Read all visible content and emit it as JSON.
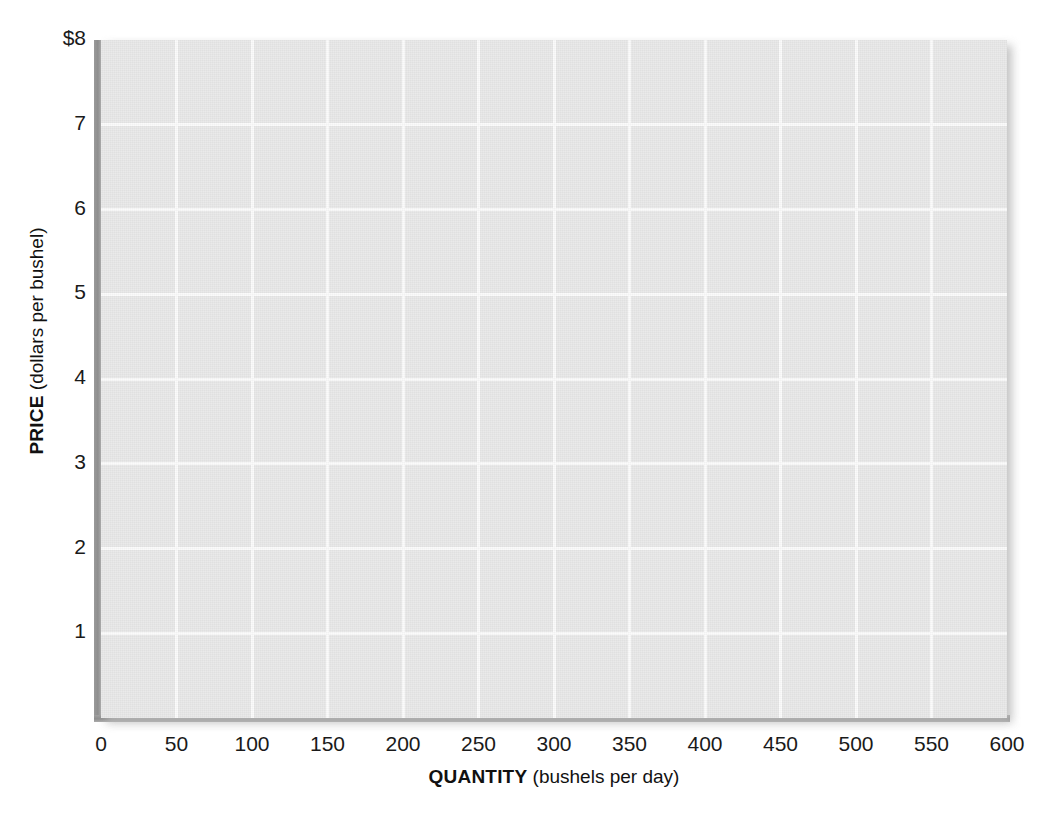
{
  "chart_data": {
    "type": "line",
    "title": "",
    "subtitle": "",
    "xlabel_bold": "QUANTITY",
    "xlabel_rest": " (bushels per day)",
    "ylabel_bold": "PRICE",
    "ylabel_rest": " (dollars per bushel)",
    "xlim": [
      0,
      600
    ],
    "ylim": [
      0,
      8
    ],
    "x_tick_values": [
      0,
      50,
      100,
      150,
      200,
      250,
      300,
      350,
      400,
      450,
      500,
      550,
      600
    ],
    "x_tick_labels": [
      "0",
      "50",
      "100",
      "150",
      "200",
      "250",
      "300",
      "350",
      "400",
      "450",
      "500",
      "550",
      "600"
    ],
    "y_tick_values": [
      1,
      2,
      3,
      4,
      5,
      6,
      7,
      8
    ],
    "y_tick_labels": [
      "1",
      "2",
      "3",
      "4",
      "5",
      "6",
      "7",
      "$8"
    ],
    "grid": true,
    "grid_color": "#fbfbfb",
    "plot_background": "#e8e8e8",
    "axis_color": "#8d8d8d",
    "legend": [],
    "series": [],
    "annotations": [],
    "note": "Blank grid — no data series plotted"
  },
  "figure": {
    "page_background": "#ffffff",
    "text_color": "#1a1a1a"
  }
}
